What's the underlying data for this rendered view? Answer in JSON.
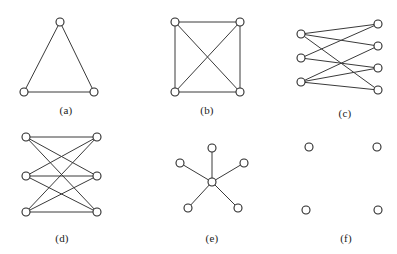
{
  "figure": {
    "width": 397,
    "height": 254,
    "background_color": "#ffffff",
    "edge_color": "#3a3a3a",
    "node_fill_color": "#ffffff",
    "node_stroke_color": "#2a2a2a",
    "node_radius": 4
  },
  "panels": [
    {
      "id": "a",
      "caption": "(a)",
      "caption_pos": {
        "x": 66,
        "y": 104
      },
      "description": "triangle complete graph K3",
      "nodes": [
        {
          "id": "a0",
          "x": 60,
          "y": 22
        },
        {
          "id": "a1",
          "x": 24,
          "y": 92
        },
        {
          "id": "a2",
          "x": 94,
          "y": 92
        }
      ],
      "edges": [
        {
          "from": "a0",
          "to": "a1"
        },
        {
          "from": "a0",
          "to": "a2"
        },
        {
          "from": "a1",
          "to": "a2"
        }
      ]
    },
    {
      "id": "b",
      "caption": "(b)",
      "caption_pos": {
        "x": 207,
        "y": 104
      },
      "description": "complete graph K4 drawn as square with diagonals",
      "nodes": [
        {
          "id": "b0",
          "x": 175,
          "y": 22
        },
        {
          "id": "b1",
          "x": 240,
          "y": 22
        },
        {
          "id": "b2",
          "x": 175,
          "y": 92
        },
        {
          "id": "b3",
          "x": 240,
          "y": 92
        }
      ],
      "edges": [
        {
          "from": "b0",
          "to": "b1"
        },
        {
          "from": "b0",
          "to": "b2"
        },
        {
          "from": "b1",
          "to": "b3"
        },
        {
          "from": "b2",
          "to": "b3"
        },
        {
          "from": "b0",
          "to": "b3"
        },
        {
          "from": "b1",
          "to": "b2"
        }
      ]
    },
    {
      "id": "c",
      "caption": "(c)",
      "caption_pos": {
        "x": 345,
        "y": 107
      },
      "description": "bipartite graph with 3 left nodes and 4 right nodes",
      "nodes": [
        {
          "id": "c0",
          "x": 301,
          "y": 34
        },
        {
          "id": "c1",
          "x": 301,
          "y": 58
        },
        {
          "id": "c2",
          "x": 301,
          "y": 82
        },
        {
          "id": "c3",
          "x": 378,
          "y": 24
        },
        {
          "id": "c4",
          "x": 378,
          "y": 46
        },
        {
          "id": "c5",
          "x": 378,
          "y": 68
        },
        {
          "id": "c6",
          "x": 378,
          "y": 90
        }
      ],
      "edges": [
        {
          "from": "c0",
          "to": "c3"
        },
        {
          "from": "c0",
          "to": "c4"
        },
        {
          "from": "c0",
          "to": "c6"
        },
        {
          "from": "c1",
          "to": "c5"
        },
        {
          "from": "c1",
          "to": "c3"
        },
        {
          "from": "c2",
          "to": "c4"
        },
        {
          "from": "c2",
          "to": "c5"
        },
        {
          "from": "c2",
          "to": "c6"
        }
      ]
    },
    {
      "id": "d",
      "caption": "(d)",
      "caption_pos": {
        "x": 62,
        "y": 232
      },
      "description": "complete bipartite graph K3,3",
      "nodes": [
        {
          "id": "d0",
          "x": 26,
          "y": 137
        },
        {
          "id": "d1",
          "x": 26,
          "y": 176
        },
        {
          "id": "d2",
          "x": 26,
          "y": 212
        },
        {
          "id": "d3",
          "x": 97,
          "y": 137
        },
        {
          "id": "d4",
          "x": 97,
          "y": 176
        },
        {
          "id": "d5",
          "x": 97,
          "y": 212
        }
      ],
      "edges": [
        {
          "from": "d0",
          "to": "d3"
        },
        {
          "from": "d0",
          "to": "d4"
        },
        {
          "from": "d0",
          "to": "d5"
        },
        {
          "from": "d1",
          "to": "d3"
        },
        {
          "from": "d1",
          "to": "d4"
        },
        {
          "from": "d1",
          "to": "d5"
        },
        {
          "from": "d2",
          "to": "d3"
        },
        {
          "from": "d2",
          "to": "d4"
        },
        {
          "from": "d2",
          "to": "d5"
        }
      ]
    },
    {
      "id": "e",
      "caption": "(e)",
      "caption_pos": {
        "x": 212,
        "y": 232
      },
      "description": "star graph K1,5 with central hub and five spokes",
      "nodes": [
        {
          "id": "e_center",
          "x": 212,
          "y": 182
        },
        {
          "id": "e1",
          "x": 212,
          "y": 148
        },
        {
          "id": "e2",
          "x": 180,
          "y": 163
        },
        {
          "id": "e3",
          "x": 244,
          "y": 163
        },
        {
          "id": "e4",
          "x": 188,
          "y": 208
        },
        {
          "id": "e5",
          "x": 238,
          "y": 208
        }
      ],
      "edges": [
        {
          "from": "e_center",
          "to": "e1"
        },
        {
          "from": "e_center",
          "to": "e2"
        },
        {
          "from": "e_center",
          "to": "e3"
        },
        {
          "from": "e_center",
          "to": "e4"
        },
        {
          "from": "e_center",
          "to": "e5"
        }
      ]
    },
    {
      "id": "f",
      "caption": "(f)",
      "caption_pos": {
        "x": 346,
        "y": 232
      },
      "description": "empty null graph with four isolated vertices and no edges",
      "nodes": [
        {
          "id": "f0",
          "x": 309,
          "y": 147
        },
        {
          "id": "f1",
          "x": 377,
          "y": 147
        },
        {
          "id": "f2",
          "x": 306,
          "y": 210
        },
        {
          "id": "f3",
          "x": 378,
          "y": 210
        }
      ],
      "edges": []
    }
  ]
}
